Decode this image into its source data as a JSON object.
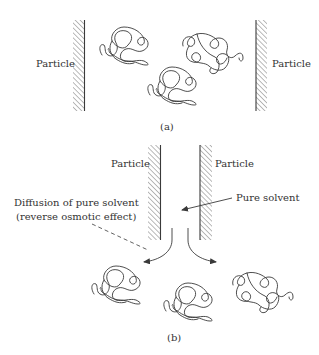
{
  "figure": {
    "panel_a": {
      "caption": "(a)",
      "particle_left_label": "Particle",
      "particle_right_label": "Particle",
      "coil_count": 3
    },
    "panel_b": {
      "caption": "(b)",
      "particle_left_label": "Particle",
      "particle_right_label": "Particle",
      "pure_solvent_label": "Pure solvent",
      "diffusion_label_line1": "Diffusion of pure solvent",
      "diffusion_label_line2": "(reverse osmotic effect)",
      "coil_count": 3
    },
    "colors": {
      "line": "#3a3a3a",
      "text": "#333333",
      "background": "#ffffff"
    }
  }
}
